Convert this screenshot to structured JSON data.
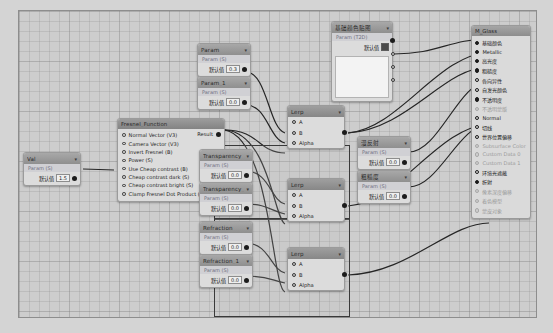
{
  "app": {
    "kind": "shader-node-graph-editor"
  },
  "colors": {
    "canvas_bg": "#cdcdcd",
    "node_bg": "#dcdcdc",
    "node_header": "#9b9b9b",
    "wire": "#252525",
    "frame_border": "#3a3a3a",
    "value_field_bg": "#efefef"
  },
  "labels": {
    "default_value": "默认值",
    "result": "Result",
    "param_sub": "Param (S)",
    "param_sub_v3": "Param (V3)",
    "caret": "▾"
  },
  "nodes": {
    "val": {
      "title": "Val",
      "subtitle": "Param (S)",
      "value": "1.5"
    },
    "fresnel": {
      "title": "Fresnel_Function",
      "output_label": "Result",
      "params": [
        "Normal Vector (V3)",
        "Camera Vector (V3)",
        "Invert Fresnel (B)",
        "Power (S)",
        "Use Cheap contrast (B)",
        "Cheap contrast dark (S)",
        "Cheap contrast bright (S)",
        "Clamp Fresnel Dot Product (B)"
      ]
    },
    "param_top": {
      "title": "Param",
      "subtitle": "Param (S)",
      "value": "0.3"
    },
    "param_1": {
      "title": "Param_1",
      "subtitle": "Param (S)",
      "value": "0.0"
    },
    "transparency": {
      "title": "Transparency",
      "subtitle": "Param (S)",
      "value": "0.0"
    },
    "transparency_1": {
      "title": "Transparency_1",
      "subtitle": "Param (S)",
      "value": "0.0"
    },
    "refraction": {
      "title": "Refraction",
      "subtitle": "Param (S)",
      "value": "0.0"
    },
    "refraction_1": {
      "title": "Refraction_1",
      "subtitle": "Param (S)",
      "value": "0.0"
    },
    "texture": {
      "title": "基础颜色贴图",
      "subtitle": "Param (T2D)",
      "value_label": "默认值"
    },
    "param_cn_a": {
      "title": "漫反射",
      "subtitle": "Param (S)",
      "value": "0.0"
    },
    "param_cn_b": {
      "title": "粗糙度",
      "subtitle": "Param (S)",
      "value": "0.0"
    },
    "lerp_top": {
      "title": "Lerp",
      "inputs": [
        "A",
        "B",
        "Alpha"
      ]
    },
    "lerp_mid": {
      "title": "Lerp",
      "inputs": [
        "A",
        "B",
        "Alpha"
      ]
    },
    "lerp_bot": {
      "title": "Lerp",
      "inputs": [
        "A",
        "B",
        "Alpha"
      ]
    }
  },
  "output_panel": {
    "title": "M_Glass",
    "rows": [
      {
        "label": "基础颜色",
        "style": "filled",
        "dim": false
      },
      {
        "label": "Metallic",
        "style": "filled",
        "dim": false
      },
      {
        "label": "高光度",
        "style": "filled",
        "dim": false
      },
      {
        "label": "粗糙度",
        "style": "filled",
        "dim": false
      },
      {
        "label": "各向异性",
        "style": "ring",
        "dim": false
      },
      {
        "label": "自发光颜色",
        "style": "ring",
        "dim": false
      },
      {
        "label": "不透明度",
        "style": "filled",
        "dim": false
      },
      {
        "label": "不透明蒙版",
        "style": "ring",
        "dim": true
      },
      {
        "label": "Normal",
        "style": "ring",
        "dim": false
      },
      {
        "label": "切线",
        "style": "ring",
        "dim": false
      },
      {
        "label": "世界位置偏移",
        "style": "ring",
        "dim": false
      },
      {
        "label": "Subsurface Color",
        "style": "ring",
        "dim": true
      },
      {
        "label": "Custom Data 0",
        "style": "ring",
        "dim": true
      },
      {
        "label": "Custom Data 1",
        "style": "ring",
        "dim": true
      },
      {
        "label": "环境光遮蔽",
        "style": "ring",
        "dim": false
      },
      {
        "label": "折射",
        "style": "filled",
        "dim": false
      },
      {
        "label": "像素深度偏移",
        "style": "ring",
        "dim": true
      },
      {
        "label": "着色模型",
        "style": "ring",
        "dim": true
      },
      {
        "label": "蒙皮对象",
        "style": "ring",
        "dim": true
      }
    ]
  },
  "frames": [
    {
      "name": "transparency-group"
    },
    {
      "name": "refraction-group"
    }
  ]
}
